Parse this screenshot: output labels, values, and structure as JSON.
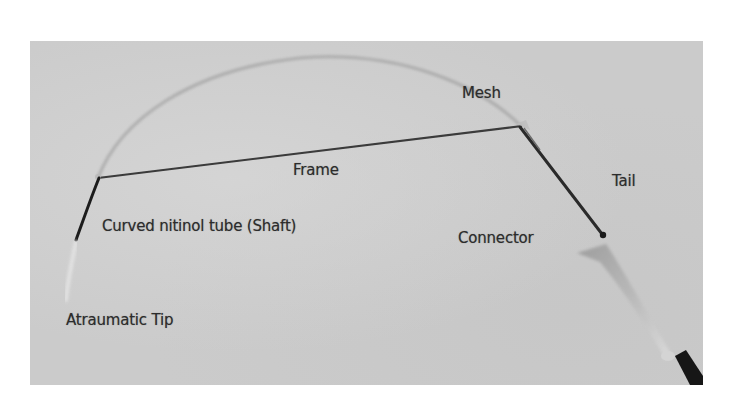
{
  "figure": {
    "labels": {
      "mesh": "Mesh",
      "frame": "Frame",
      "tail": "Tail",
      "shaft": "Curved nitinol tube (Shaft)",
      "connector": "Connector",
      "tip": "Atraumatic Tip"
    }
  },
  "colors": {
    "page_background": "#ffffff",
    "photo_background": "#cbcbcb",
    "wire": "#2a2a2a",
    "mesh": "#9a9a9a",
    "connector": "#b0b0b0",
    "cable": "#1a1a1a",
    "label_text": "#2c2c2c"
  }
}
